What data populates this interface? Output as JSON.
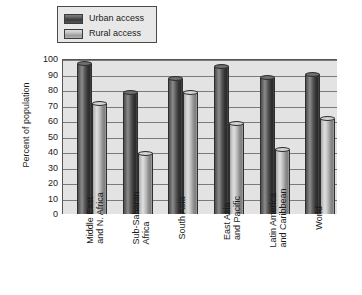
{
  "chart_data": {
    "type": "bar",
    "title": "",
    "xlabel": "",
    "ylabel": "Percent of population",
    "ylim": [
      0,
      100
    ],
    "ytick_step": 10,
    "yticks": [
      "100",
      "90",
      "80",
      "70",
      "60",
      "50",
      "40",
      "30",
      "20",
      "10",
      "0"
    ],
    "grid": true,
    "legend_position": "top-left",
    "categories": [
      "Middle East and N. Africa",
      "Sub-Saharan Africa",
      "South Asia",
      "East Asia and Pacific",
      "Latin America and Caribbean",
      "World"
    ],
    "category_lines": [
      [
        "Middle East",
        "and N. Africa"
      ],
      [
        "Sub-Saharan",
        "Africa"
      ],
      [
        "South Asia",
        ""
      ],
      [
        "East Asia",
        "and Pacific"
      ],
      [
        "Latin America",
        "and Caribbean"
      ],
      [
        "World",
        ""
      ]
    ],
    "series": [
      {
        "name": "Urban access",
        "color": "#3f3f3f",
        "values": [
          97,
          78,
          87,
          95,
          88,
          90
        ]
      },
      {
        "name": "Rural access",
        "color": "#bdbdbd",
        "values": [
          71,
          39,
          78,
          58,
          41,
          61
        ]
      }
    ]
  },
  "legend": {
    "items": [
      {
        "label": "Urban access",
        "swatch": "urban"
      },
      {
        "label": "Rural access",
        "swatch": "rural"
      }
    ]
  },
  "colors": {
    "plot_background": "#e3e3e3",
    "gridline": "#7a7a7a",
    "axis": "#555555",
    "text": "#1a1a1a",
    "legend_background": "#e8e8e8",
    "legend_border": "#4a4a4a"
  }
}
